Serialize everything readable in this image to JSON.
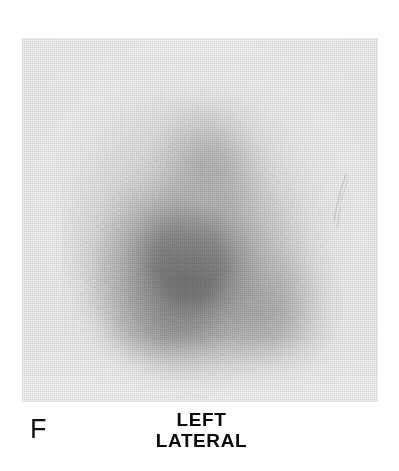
{
  "figure": {
    "panel_letter": "F",
    "view_annotation": {
      "line1": "LEFT",
      "line2": "LATERAL"
    },
    "modality": "scintigraphy-scan",
    "colors": {
      "paper": "#f2f2f1",
      "page_background": "#ffffff",
      "ink": "#0b0b0b",
      "panel_letter": "#111111",
      "uptake_core": "#000000",
      "uptake_mid": "#3c3c3c",
      "uptake_halo": "#9b9b9b"
    },
    "film": {
      "left": 22,
      "top": 38,
      "width": 356,
      "height": 364
    },
    "uptake": {
      "shape": "triangular-heart",
      "apex_position": "top-center",
      "core_center_x": 168,
      "core_center_y": 219,
      "extent_left": 104,
      "extent_right": 318,
      "extent_top": 80,
      "extent_bottom": 360,
      "intensity_peak_label": "maximum",
      "regions": [
        {
          "name": "apex",
          "intensity": "moderate"
        },
        {
          "name": "core",
          "intensity": "maximum"
        },
        {
          "name": "left-lower-lobe",
          "intensity": "moderate"
        },
        {
          "name": "right-lower-lobe",
          "intensity": "low"
        },
        {
          "name": "halo",
          "intensity": "faint"
        }
      ]
    },
    "artifacts": [
      {
        "name": "emulsion-scratch",
        "x": 306,
        "y": 132
      },
      {
        "name": "adhesive-label-edge",
        "x": 62,
        "y": 358
      }
    ]
  }
}
